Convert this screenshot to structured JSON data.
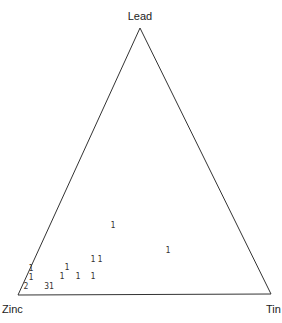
{
  "chart_data": {
    "type": "scatter",
    "subtype": "ternary",
    "title": "",
    "vertices": [
      {
        "name": "Lead",
        "position": "top",
        "x": 140,
        "y": 28,
        "label_x": 140,
        "label_y": 20
      },
      {
        "name": "Zinc",
        "position": "bottom-left",
        "x": 18,
        "y": 295,
        "label_x": 16,
        "label_y": 313
      },
      {
        "name": "Tin",
        "position": "bottom-right",
        "x": 271,
        "y": 294,
        "label_x": 266,
        "label_y": 313
      }
    ],
    "point_markers": "count labels",
    "points": [
      {
        "label": "1",
        "x": 113,
        "y": 228
      },
      {
        "label": "1",
        "x": 168,
        "y": 253
      },
      {
        "label": "1",
        "x": 100,
        "y": 262
      },
      {
        "label": "1",
        "x": 93,
        "y": 262
      },
      {
        "label": "1",
        "x": 31,
        "y": 271
      },
      {
        "label": "1",
        "x": 67,
        "y": 270
      },
      {
        "label": "1",
        "x": 31,
        "y": 280
      },
      {
        "label": "1",
        "x": 62,
        "y": 279
      },
      {
        "label": "1",
        "x": 78,
        "y": 279
      },
      {
        "label": "1",
        "x": 93,
        "y": 279
      },
      {
        "label": "2",
        "x": 26,
        "y": 289
      },
      {
        "label": "31",
        "x": 49,
        "y": 289
      }
    ],
    "grid": false,
    "legend": null
  },
  "colors": {
    "axis": "#333333",
    "text": "#222222",
    "background": "#ffffff"
  }
}
